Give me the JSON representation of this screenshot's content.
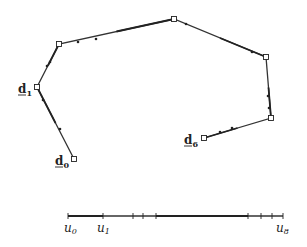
{
  "diagram": {
    "type": "control-polygon-with-knot-vector",
    "control_points": [
      {
        "id": "d0",
        "label": "d",
        "sub": "0",
        "x": 74,
        "y": 159,
        "labeled": true
      },
      {
        "id": "d1",
        "label": "d",
        "sub": "1",
        "x": 37,
        "y": 87,
        "labeled": true
      },
      {
        "id": "d2",
        "label": "",
        "sub": "",
        "x": 59,
        "y": 44,
        "labeled": false
      },
      {
        "id": "d3",
        "label": "",
        "sub": "",
        "x": 174,
        "y": 19,
        "labeled": false
      },
      {
        "id": "d4",
        "label": "",
        "sub": "",
        "x": 266,
        "y": 57,
        "labeled": false
      },
      {
        "id": "d5",
        "label": "",
        "sub": "",
        "x": 271,
        "y": 118,
        "labeled": false
      },
      {
        "id": "d6",
        "label": "d",
        "sub": "6",
        "x": 204,
        "y": 138,
        "labeled": true
      }
    ],
    "polygon_ticks": [
      [
        60,
        129
      ],
      [
        43,
        100
      ],
      [
        47,
        66
      ],
      [
        50,
        62
      ],
      [
        78,
        42
      ],
      [
        96,
        39
      ],
      [
        186,
        24
      ],
      [
        252,
        52
      ],
      [
        268,
        96
      ],
      [
        269,
        108
      ],
      [
        232,
        128
      ],
      [
        220,
        132
      ]
    ],
    "knot_axis": {
      "y": 216,
      "x_start": 68,
      "x_end": 283,
      "ticks": [
        68,
        103,
        133,
        143,
        156,
        248,
        261,
        272,
        283
      ],
      "labels": [
        {
          "text": "u",
          "sub": "0",
          "x": 64
        },
        {
          "text": "u",
          "sub": "1",
          "x": 97
        },
        {
          "text": "u",
          "sub": "8",
          "x": 276
        }
      ]
    }
  }
}
